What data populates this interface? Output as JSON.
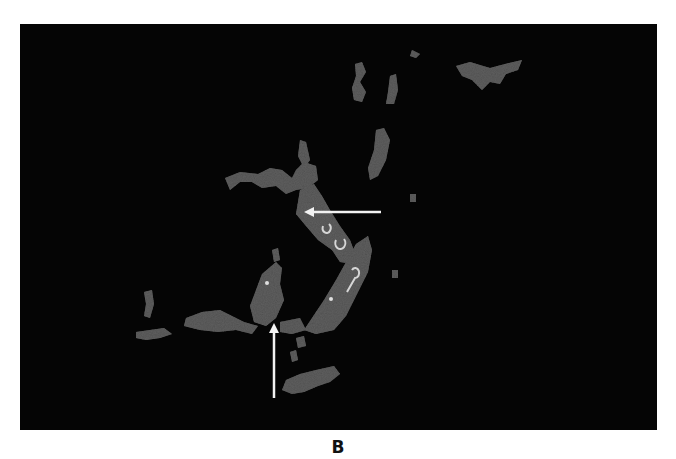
{
  "figure": {
    "panel_label": "B",
    "background_color": "#050505",
    "signal_color": "#6e6e6e",
    "bright_color": "#cfcfcf",
    "annotations": [
      {
        "type": "arrow",
        "direction": "left",
        "color": "#f2f2f2"
      },
      {
        "type": "arrow",
        "direction": "up",
        "color": "#f2f2f2"
      }
    ]
  }
}
